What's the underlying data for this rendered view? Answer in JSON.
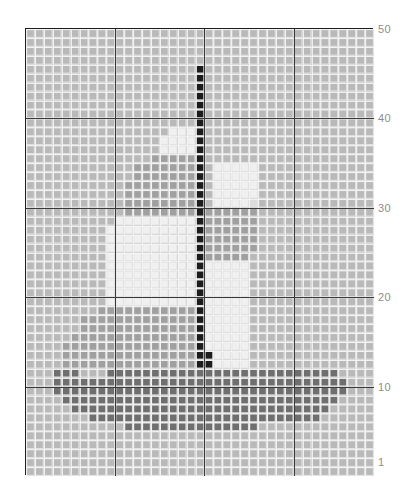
{
  "chart_data": {
    "type": "heatmap",
    "title": "",
    "subtitle": "",
    "xlabel": "",
    "ylabel": "",
    "grid": true,
    "legend_position": "none",
    "columns": 39,
    "rows": 50,
    "xlim": [
      1,
      39
    ],
    "ylim": [
      1,
      50
    ],
    "x_tick_labels": [],
    "y_tick_labels": [
      "50",
      "40",
      "30",
      "20",
      "10",
      "1"
    ],
    "y_tick_values": [
      50,
      40,
      30,
      20,
      10,
      1
    ],
    "major_gridline_interval": 10,
    "palette": {
      "background_cell": "#b9b9b9",
      "cell_grid": "#e2e2e2",
      "light_sail": "#f0f0f0",
      "mid_sail": "#dcdcdc",
      "mid_gray": "#a0a0a0",
      "dark_gray": "#7a7a7a",
      "hull": "#6f6f6f",
      "mast_black": "#1c1c1c",
      "border": "#1d1d1d",
      "major_gridline": "#3a3a3a",
      "axis_label": "#8d8d8d",
      "page_background": "#ffffff"
    },
    "symbols": {
      "0": {
        "name": "background",
        "color": "#b9b9b9"
      },
      "1": {
        "name": "mast-black",
        "color": "#1c1c1c"
      },
      "2": {
        "name": "hull-dark",
        "color": "#6f6f6f"
      },
      "3": {
        "name": "mid-gray",
        "color": "#a0a0a0"
      },
      "4": {
        "name": "sail-bright",
        "color": "#f0f0f0"
      },
      "5": {
        "name": "sail-mid",
        "color": "#dcdcdc"
      }
    },
    "cells": [
      "000000000000000000000000000000000000000",
      "000000000000000000000000000000000000000",
      "000000000000000000000000000000000000000",
      "000000000000000000000000000000000000000",
      "000000000000000000010000000000000000000",
      "000000000000000000010000000000000000000",
      "000000000000000000010000000000000000000",
      "000000000000000000010000000000000000000",
      "000000000000000000010000000000000000000",
      "000000000000000000010000000000000000000",
      "000000000000000000010000000000000000000",
      "000000000000000044410000000000000000000",
      "000000000000000444410000000000000000000",
      "000000000000000444410000000000000000000",
      "000000000000003333310000000000000000000",
      "000000000000333333310444440000000000000",
      "000000000000333333310444440000000000000",
      "000000000003333333310444440000000000000",
      "000000000003333333310444440000000000000",
      "000000000003333333310444450000000000000",
      "000000000003333333313333330000000000000",
      "000000000044444444413333330000000000000",
      "000000000444444444413333330000000000000",
      "000000000444444444413333330000000000000",
      "000000000444444444413333330000000000000",
      "000000000444444444413333300000000000000",
      "000000000444444444414444400000000000000",
      "000000000444444444414444400000000000000",
      "000000000444444444414444400000000000000",
      "000000000444444444414444400000000000000",
      "000000000444444444414444400000000000000",
      "000000003333333333314444400000000000000",
      "000000333333333333314444400000000000000",
      "000000333333333333314444400000000000000",
      "000003333333333333314444400000000000000",
      "000033333333333333314444400000000000000",
      "000033333333333333311444400000000000000",
      "000033333333333333311444400000000000000",
      "000222000222222222222222222222222220000",
      "000222222222222222222222222222222222000",
      "000222222222222222222222222222222222000",
      "000022222222222222222222222222222220000",
      "000002222222222222222222222222222200000",
      "000000022222222222222222222222222000000",
      "000000000002222222222222220000000000000",
      "000000000000000000000000000000000000000",
      "000000000000000000000000000000000000000",
      "000000000000000000000000000000000000000",
      "000000000000000000000000000000000000000",
      "000000000000000000000000000000000000000"
    ]
  },
  "yaxis": {
    "ticks": [
      {
        "label": "50",
        "value": 50
      },
      {
        "label": "40",
        "value": 40
      },
      {
        "label": "30",
        "value": 30
      },
      {
        "label": "20",
        "value": 20
      },
      {
        "label": "10",
        "value": 10
      },
      {
        "label": "1",
        "value": 1
      }
    ]
  }
}
